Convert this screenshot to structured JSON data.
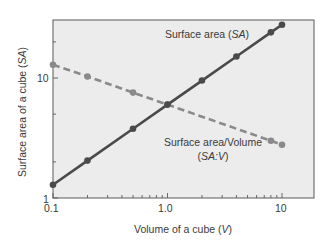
{
  "chart_data": {
    "type": "line",
    "title": "",
    "xlabel": "Volume of a cube (V)",
    "xlabel_text": "Volume of a cube (",
    "xlabel_var": "V",
    "ylabel": "Surface area of a cube (SA)",
    "ylabel_text": "Surface area of a cube (",
    "ylabel_var": "SA",
    "x_scale": "log",
    "y_scale": "log",
    "xlim": [
      0.1,
      15
    ],
    "ylim": [
      1,
      45
    ],
    "x_ticks": [
      "0.1",
      "1.0",
      "10"
    ],
    "y_ticks": [
      "1",
      "10"
    ],
    "grid": false,
    "series": [
      {
        "name": "Surface area (SA)",
        "label_text": "Surface area (",
        "label_var": "SA",
        "style": "solid",
        "color": "#4a4a4a",
        "x": [
          0.1,
          0.2,
          0.5,
          1.0,
          2.0,
          4.0,
          8.0,
          10.0
        ],
        "values": [
          1.29,
          2.05,
          3.78,
          6.0,
          9.52,
          15.1,
          24.0,
          27.8
        ]
      },
      {
        "name": "Surface area/Volume (SA:V)",
        "label_line1": "Surface area/Volume",
        "label_line2_text": "(",
        "label_line2_var": "SA:V",
        "style": "dashed",
        "color": "#8a8a8a",
        "x": [
          0.1,
          0.2,
          0.5,
          1.0,
          8.0,
          10.0
        ],
        "values": [
          12.9,
          10.3,
          7.56,
          6.0,
          3.0,
          2.78
        ]
      }
    ]
  },
  "colors": {
    "plot_background": "#ececec",
    "frame": "#5a5a5a",
    "sa_line": "#4a4a4a",
    "sav_line": "#8c8c8c"
  }
}
